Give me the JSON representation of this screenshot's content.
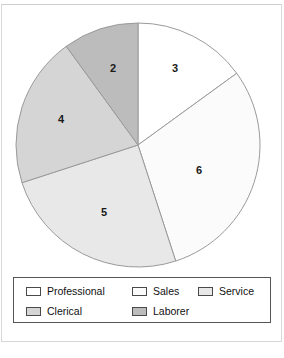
{
  "chart_data": {
    "type": "pie",
    "title": "",
    "categories": [
      "Professional",
      "Sales",
      "Service",
      "Clerical",
      "Laborer"
    ],
    "values": [
      3,
      6,
      5,
      4,
      2
    ],
    "total": 20,
    "labels": [
      "3",
      "6",
      "5",
      "4",
      "2"
    ],
    "legend_position": "bottom",
    "grid": false,
    "start_angle_deg": 0,
    "direction": "clockwise",
    "slice_colors": [
      "#ffffff",
      "#fbfbfb",
      "#e8e8e8",
      "#d5d5d5",
      "#bcbcbc"
    ],
    "slice_edge_color": "#9a9a9a",
    "slices": [
      {
        "name": "Professional",
        "value": 3,
        "label": "3",
        "color": "#ffffff",
        "start_deg": 0,
        "end_deg": 54,
        "label_x": 175,
        "label_y": 68
      },
      {
        "name": "Sales",
        "value": 6,
        "label": "6",
        "color": "#fbfbfb",
        "start_deg": 54,
        "end_deg": 162,
        "label_x": 199,
        "label_y": 170
      },
      {
        "name": "Service",
        "value": 5,
        "label": "5",
        "color": "#e8e8e8",
        "start_deg": 162,
        "end_deg": 252,
        "label_x": 104,
        "label_y": 212
      },
      {
        "name": "Clerical",
        "value": 4,
        "label": "4",
        "color": "#d5d5d5",
        "start_deg": 252,
        "end_deg": 324,
        "label_x": 61,
        "label_y": 119
      },
      {
        "name": "Laborer",
        "value": 2,
        "label": "2",
        "color": "#bcbcbc",
        "start_deg": 324,
        "end_deg": 360,
        "label_x": 113,
        "label_y": 68
      }
    ],
    "geometry": {
      "center_x": 138,
      "center_y": 145,
      "radius": 122
    }
  },
  "legend": {
    "rows": [
      [
        {
          "label": "Professional",
          "color": "#ffffff",
          "left": 12,
          "swatch": "legend-swatch-professional"
        },
        {
          "label": "Sales",
          "color": "#fbfbfb",
          "left": 118,
          "swatch": "legend-swatch-sales"
        },
        {
          "label": "Service",
          "color": "#e8e8e8",
          "left": 184,
          "swatch": "legend-swatch-service"
        }
      ],
      [
        {
          "label": "Clerical",
          "color": "#d5d5d5",
          "left": 12,
          "swatch": "legend-swatch-clerical"
        },
        {
          "label": "Laborer",
          "color": "#bcbcbc",
          "left": 118,
          "swatch": "legend-swatch-laborer"
        }
      ]
    ]
  },
  "figure": {
    "background": "#ffffff",
    "frame_color": "#d8d8d8",
    "legend_border_color": "#555555"
  }
}
